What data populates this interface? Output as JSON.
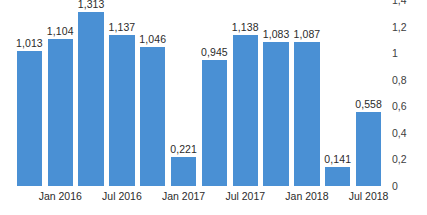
{
  "chart": {
    "accent_color": "#4a90d4",
    "label_color": "#2b2b2b",
    "axis_label_color": "#3d3d3d",
    "background": "#ffffff"
  },
  "chart_data": {
    "type": "bar",
    "title": "",
    "subtitle": "",
    "xlabel": "",
    "ylabel": "",
    "grid": false,
    "legend": "none",
    "y_axis_position": "right",
    "decimal_separator": ",",
    "ylim": [
      0,
      1.4
    ],
    "yticks": [
      0,
      0.2,
      0.4,
      0.6,
      0.8,
      1,
      1.2,
      1.4
    ],
    "ytick_labels": [
      "0",
      "0,2",
      "0,4",
      "0,6",
      "0,8",
      "1",
      "1,2",
      "1,4"
    ],
    "categories": [
      "1",
      "2",
      "3",
      "4",
      "5",
      "6",
      "7",
      "8",
      "9",
      "10",
      "11",
      "12"
    ],
    "values": [
      1.013,
      1.104,
      1.313,
      1.137,
      1.046,
      0.221,
      0.945,
      1.138,
      1.083,
      1.087,
      0.141,
      0.558
    ],
    "data_labels": [
      "1,013",
      "1,104",
      "1,313",
      "1,137",
      "1,046",
      "0,221",
      "0,945",
      "1,138",
      "1,083",
      "1,087",
      "0,141",
      "0,558"
    ],
    "xtick_labels": [
      "Jan 2016",
      "Jul 2016",
      "Jan 2017",
      "Jul 2017",
      "Jan 2018",
      "Jul 2018"
    ],
    "xtick_positions": [
      1,
      3,
      5,
      7,
      9,
      11
    ]
  }
}
